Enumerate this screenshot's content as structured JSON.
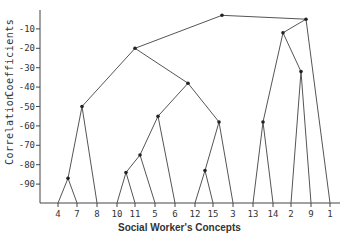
{
  "chart_data": {
    "type": "dendrogram",
    "title": "",
    "xlabel": "Social Worker's Concepts",
    "ylabel": "Correlation Coefficients",
    "ylim": [
      -100,
      0
    ],
    "yticks": [
      "-10",
      "-20",
      "-30",
      "-40",
      "-50",
      "-60",
      "-70",
      "-80",
      "-90"
    ],
    "leaves": [
      "4",
      "7",
      "8",
      "10",
      "11",
      "5",
      "6",
      "12",
      "15",
      "3",
      "13",
      "14",
      "2",
      "9",
      "1"
    ],
    "merges": [
      {
        "children": [
          "4",
          "7"
        ],
        "height": -87
      },
      {
        "children": [
          "(4,7)",
          "8"
        ],
        "height": -50
      },
      {
        "children": [
          "10",
          "11"
        ],
        "height": -84
      },
      {
        "children": [
          "(10,11)",
          "5"
        ],
        "height": -75
      },
      {
        "children": [
          "(10,11,5)",
          "6"
        ],
        "height": -55
      },
      {
        "children": [
          "12",
          "15"
        ],
        "height": -83
      },
      {
        "children": [
          "(12,15)",
          "3"
        ],
        "height": -58
      },
      {
        "children": [
          "(10,11,5,6)",
          "(12,15,3)"
        ],
        "height": -38
      },
      {
        "children": [
          "(4,7,8)",
          "(10,11,5,6,12,15,3)"
        ],
        "height": -20
      },
      {
        "children": [
          "13",
          "14"
        ],
        "height": -58
      },
      {
        "children": [
          "2",
          "9"
        ],
        "height": -32
      },
      {
        "children": [
          "(13,14)",
          "(2,9)"
        ],
        "height": -12
      },
      {
        "children": [
          "(13,14,2,9)",
          "1"
        ],
        "height": -5
      },
      {
        "children": [
          "left-cluster",
          "right-cluster"
        ],
        "height": -3
      }
    ],
    "grid": false
  },
  "axis": {
    "ylabel_part1": "Correlation",
    "ylabel_part2": "Coefficients",
    "xlabel": "Social Worker's Concepts"
  }
}
